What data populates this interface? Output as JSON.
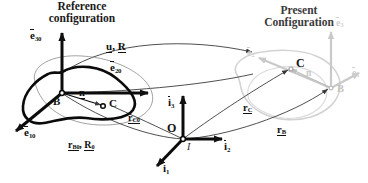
{
  "figure": {
    "type": "continuum-mechanics-kinematics-diagram",
    "width": 368,
    "height": 183,
    "background": "#ffffff"
  },
  "titles": {
    "reference": "Reference\nconfiguration",
    "reference_line1": "Reference",
    "reference_line2": "configuration",
    "present_line1": "Present",
    "present_line2": "Configuration"
  },
  "colors": {
    "reference_ink": "#111111",
    "present_ink": "#c9c9c9",
    "present_title_ink": "#2b2b2b",
    "inertial_ink": "#111111",
    "thin_curve": "#4a4a4a",
    "background": "#ffffff"
  },
  "reference_configuration": {
    "origin_point": "B",
    "material_point": "C",
    "basis": [
      {
        "symbol": "e",
        "sub": "10",
        "overbar": true,
        "direction": "down-left"
      },
      {
        "symbol": "e",
        "sub": "20",
        "overbar": true,
        "direction": "right"
      },
      {
        "symbol": "e",
        "sub": "30",
        "overbar": true,
        "direction": "up"
      }
    ],
    "relative_vector": {
      "symbol": "n",
      "underline": true
    },
    "position_vector_C": {
      "symbol": "r",
      "sub": "C0",
      "underline": true
    },
    "position_vector_B": {
      "symbol": "r",
      "sub": "B0",
      "underline": true
    },
    "rotation_tensor_0": {
      "symbol": "R",
      "sub": "0",
      "underline": true
    },
    "position_and_rotation_label": "r_B0 , R_0"
  },
  "present_configuration": {
    "origin_point": "B",
    "material_point": "C",
    "basis": [
      {
        "symbol": "e",
        "sub": "1",
        "overbar": true,
        "direction": "right"
      },
      {
        "symbol": "e",
        "sub": "2",
        "overbar": true,
        "direction": "down-right"
      },
      {
        "symbol": "e",
        "sub": "3",
        "overbar": true,
        "direction": "up"
      }
    ],
    "relative_vector": {
      "symbol": "n",
      "underline": true
    },
    "position_vector_C": {
      "symbol": "r",
      "sub": "C",
      "underline": true
    },
    "position_vector_B": {
      "symbol": "r",
      "sub": "B",
      "underline": true
    }
  },
  "mapping": {
    "label": "u, R",
    "displacement": {
      "symbol": "u",
      "underline": true
    },
    "rotation": {
      "symbol": "R",
      "underline": true
    }
  },
  "inertial_frame": {
    "origin_label": "O",
    "frame_label": "I",
    "basis": [
      {
        "symbol": "i",
        "sub": "1",
        "overbar": true,
        "direction": "down-left"
      },
      {
        "symbol": "i",
        "sub": "2",
        "overbar": true,
        "direction": "right"
      },
      {
        "symbol": "i",
        "sub": "3",
        "overbar": true,
        "direction": "up"
      }
    ]
  },
  "labels": {
    "e10": {
      "base": "e",
      "sub": "10"
    },
    "e20": {
      "base": "e",
      "sub": "20"
    },
    "e30": {
      "base": "e",
      "sub": "30"
    },
    "e1": {
      "base": "e",
      "sub": "1"
    },
    "e2": {
      "base": "e",
      "sub": "2"
    },
    "e3": {
      "base": "e",
      "sub": "3"
    },
    "i1": {
      "base": "i",
      "sub": "1"
    },
    "i2": {
      "base": "i",
      "sub": "2"
    },
    "i3": {
      "base": "i",
      "sub": "3"
    },
    "n": {
      "base": "n"
    },
    "ng": {
      "base": "n"
    },
    "rC0": {
      "base": "r",
      "sub": "C0"
    },
    "rB0": {
      "base": "r",
      "sub": "B0"
    },
    "R0": {
      "base": "R",
      "sub": "0"
    },
    "rC": {
      "base": "r",
      "sub": "C"
    },
    "rB": {
      "base": "r",
      "sub": "B"
    },
    "u": {
      "base": "u"
    },
    "R": {
      "base": "R"
    },
    "B": {
      "base": "B"
    },
    "C": {
      "base": "C"
    },
    "Bg": {
      "base": "B"
    },
    "Cg": {
      "base": "C"
    },
    "O": {
      "base": "O"
    },
    "I": {
      "base": "I"
    },
    "comma": ","
  }
}
